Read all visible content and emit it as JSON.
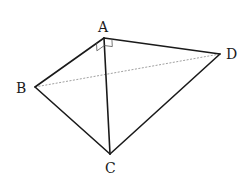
{
  "figure": {
    "type": "tetrahedron",
    "vertices": [
      {
        "id": "A",
        "label": "A"
      },
      {
        "id": "B",
        "label": "B"
      },
      {
        "id": "C",
        "label": "C"
      },
      {
        "id": "D",
        "label": "D"
      }
    ],
    "edges": [
      {
        "from": "A",
        "to": "B",
        "style": "solid"
      },
      {
        "from": "A",
        "to": "C",
        "style": "solid"
      },
      {
        "from": "A",
        "to": "D",
        "style": "solid"
      },
      {
        "from": "B",
        "to": "C",
        "style": "solid"
      },
      {
        "from": "C",
        "to": "D",
        "style": "solid"
      },
      {
        "from": "B",
        "to": "D",
        "style": "dashed"
      }
    ],
    "right_angles": [
      {
        "vertex": "A",
        "between": [
          "B",
          "C"
        ]
      },
      {
        "vertex": "A",
        "between": [
          "C",
          "D"
        ]
      }
    ]
  }
}
